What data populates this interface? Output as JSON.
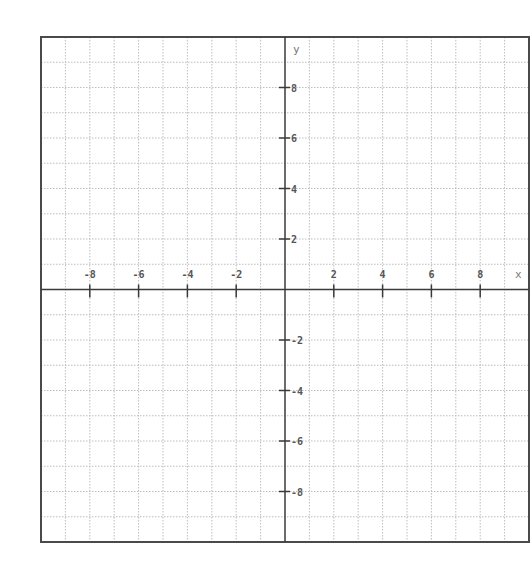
{
  "chart_data": {
    "type": "grid",
    "title": "",
    "xlabel": "x",
    "ylabel": "y",
    "xlim": [
      -10,
      10
    ],
    "ylim": [
      -10,
      10
    ],
    "grid": true,
    "grid_style": "dotted",
    "grid_step": 1,
    "x_ticks": [
      -8,
      -6,
      -4,
      -2,
      2,
      4,
      6,
      8
    ],
    "x_tick_labels": [
      "-8",
      "-6",
      "-4",
      "-2",
      "2",
      "4",
      "6",
      "8"
    ],
    "y_ticks": [
      8,
      6,
      4,
      2,
      -2,
      -4,
      -6,
      -8
    ],
    "y_tick_labels": [
      "8",
      "6",
      "4",
      "2",
      "-2",
      "-4",
      "-6",
      "-8"
    ],
    "series": [],
    "legend": null
  },
  "colors": {
    "border": "#4a4a4a",
    "axis": "#3a3a3a",
    "grid": "#bdbdbd",
    "label": "#555555"
  },
  "layout": {
    "left": 41,
    "top": 37,
    "right": 529,
    "bottom": 542
  }
}
